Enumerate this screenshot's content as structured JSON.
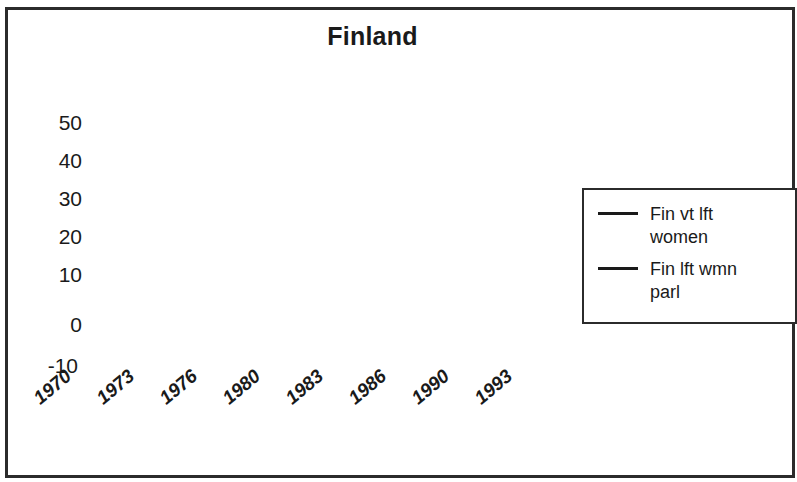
{
  "chart_data": {
    "type": "line",
    "title": "Finland",
    "xlabel": "",
    "ylabel": "",
    "grid": false,
    "legend_position": "right",
    "ylim": [
      -10,
      50
    ],
    "yticks": [
      50,
      40,
      30,
      20,
      10,
      0,
      -10
    ],
    "categories": [
      "1970",
      "1973",
      "1976",
      "1980",
      "1983",
      "1986",
      "1990",
      "1993"
    ],
    "xticklabels": [
      "1970",
      "1973",
      "1976",
      "1980",
      "1983",
      "1986",
      "1990",
      "1993"
    ],
    "series": [
      {
        "name": "Fin vt lft women",
        "color": "#1a1a1a",
        "x": [
          1970,
          1972,
          1973,
          1975,
          1976,
          1979,
          1980,
          1982,
          1983,
          1985,
          1986,
          1989,
          1990,
          1991,
          1992,
          1994,
          1995
        ],
        "values": [
          25,
          25,
          27,
          27,
          24,
          24,
          31,
          31,
          31.5,
          31.5,
          32,
          32,
          32,
          46,
          46,
          46,
          37
        ]
      },
      {
        "name": "Fin lft wmn parl",
        "color": "#1a1a1a",
        "x": [
          1972,
          1974,
          1975,
          1977,
          1978,
          1980,
          1983,
          1986,
          1989,
          1990,
          1991,
          1993,
          1994,
          1995
        ],
        "values": [
          -3,
          -3,
          -2,
          -2,
          -3.5,
          -3.5,
          -3.2,
          -3,
          -3,
          -2.8,
          2,
          2,
          2,
          4
        ]
      }
    ]
  },
  "legend": {
    "entries": [
      {
        "label": "Fin vt lft women"
      },
      {
        "label": "Fin lft wmn parl"
      }
    ]
  },
  "axes": {
    "y_tick_labels": [
      "50",
      "40",
      "30",
      "20",
      "10",
      "0",
      "-10"
    ],
    "x_tick_labels": [
      "1970",
      "1973",
      "1976",
      "1980",
      "1983",
      "1986",
      "1990",
      "1993"
    ]
  }
}
